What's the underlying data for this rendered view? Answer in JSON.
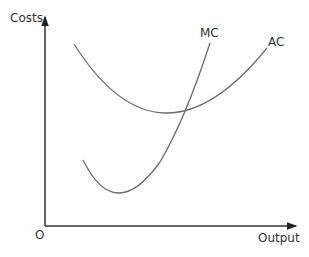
{
  "diagram": {
    "y_axis_label": "Costs",
    "x_axis_label": "Output",
    "origin_label": "O",
    "curves": [
      {
        "name": "MC",
        "label": "MC"
      },
      {
        "name": "AC",
        "label": "AC"
      }
    ],
    "line_color": "#6e6e6e",
    "axis_color": "#333333"
  }
}
